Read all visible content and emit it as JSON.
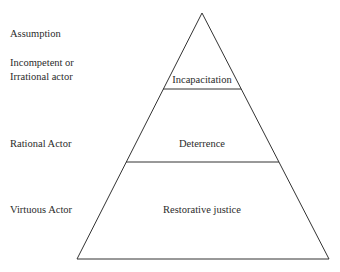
{
  "diagram": {
    "type": "pyramid",
    "column_header": "Assumption",
    "levels": [
      {
        "assumption_lines": [
          "Incompetent or",
          "Irrational actor"
        ],
        "tier_label": "Incapacitation"
      },
      {
        "assumption_lines": [
          "Rational Actor"
        ],
        "tier_label": "Deterrence"
      },
      {
        "assumption_lines": [
          "Virtuous Actor"
        ],
        "tier_label": "Restorative justice"
      }
    ],
    "colors": {
      "stroke": "#333333",
      "text": "#2b2b2b",
      "background": "#ffffff"
    }
  }
}
